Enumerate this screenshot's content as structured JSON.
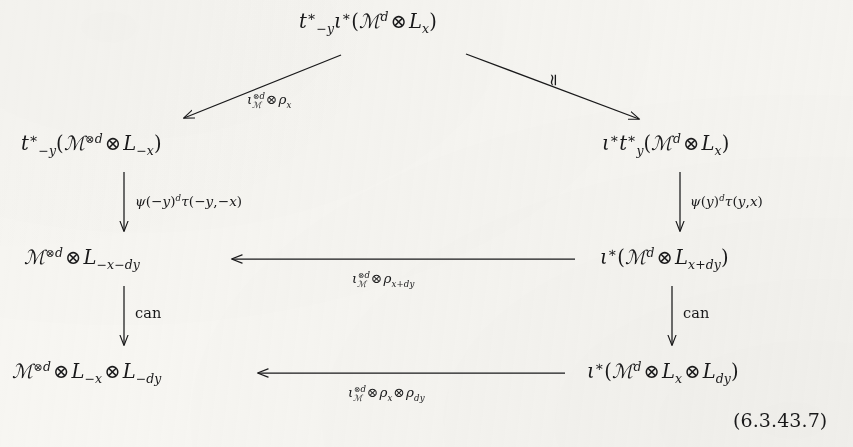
{
  "figure": {
    "type": "commutative-diagram",
    "equation_number": "(6.3.43.7)",
    "background_color": "#f7f6f2",
    "ink_color": "#19191a"
  },
  "nodes": {
    "top": {
      "id": "top-node",
      "latex": "t^*_{-y}\\iota^*(\\mathscr{M}^d \\otimes L_x)",
      "plain": "t*_{-y} i*(M^d ⊗ L_x)"
    },
    "upper_left": {
      "id": "upper-left-node",
      "latex": "t^*_{-y}(\\mathscr{M}^{\\otimes d} \\otimes L_{-x})",
      "plain": "t*_{-y}(M^{⊗d} ⊗ L_{-x})"
    },
    "upper_right": {
      "id": "upper-right-node",
      "latex": "\\iota^* t^*_{y}(\\mathscr{M}^d \\otimes L_x)",
      "plain": "i* t*_y(M^d ⊗ L_x)"
    },
    "middle_left": {
      "id": "middle-left-node",
      "latex": "\\mathscr{M}^{\\otimes d} \\otimes L_{-x-dy}",
      "plain": "M^{⊗d} ⊗ L_{-x-dy}"
    },
    "middle_right": {
      "id": "middle-right-node",
      "latex": "\\iota^*(\\mathscr{M}^d \\otimes L_{x+dy})",
      "plain": "i*(M^d ⊗ L_{x+dy})"
    },
    "bottom_left": {
      "id": "bottom-left-node",
      "latex": "\\mathscr{M}^{\\otimes d} \\otimes L_{-x} \\otimes L_{-dy}",
      "plain": "M^{⊗d} ⊗ L_{-x} ⊗ L_{-dy}"
    },
    "bottom_right": {
      "id": "bottom-right-node",
      "latex": "\\iota^*(\\mathscr{M}^d \\otimes L_x \\otimes L_{dy})",
      "plain": "i*(M^d ⊗ L_x ⊗ L_{dy})"
    }
  },
  "arrows": {
    "diag_left": {
      "from": "top",
      "to": "upper_left",
      "direction": "down-left",
      "label_latex": "\\iota_{\\mathscr{M}}^{\\otimes d} \\otimes \\rho_x",
      "label_plain": "i_M^{⊗d} ⊗ ρ_x"
    },
    "diag_right": {
      "from": "top",
      "to": "upper_right",
      "direction": "down-right",
      "label_latex": "\\simeq",
      "label_plain": "≃"
    },
    "left_vert_1": {
      "from": "upper_left",
      "to": "middle_left",
      "direction": "down",
      "label_latex": "\\psi(-y)^d \\tau(-y,-x)",
      "label_plain": "ψ(−y)^d τ(−y,−x)"
    },
    "right_vert_1": {
      "from": "upper_right",
      "to": "middle_right",
      "direction": "down",
      "label_latex": "\\psi(y)^d \\tau(y,x)",
      "label_plain": "ψ(y)^d τ(y,x)"
    },
    "middle_horiz": {
      "from": "middle_right",
      "to": "middle_left",
      "direction": "left",
      "label_latex": "\\iota_{\\mathscr{M}}^{\\otimes d} \\otimes \\rho_{x+dy}",
      "label_plain": "i_M^{⊗d} ⊗ ρ_{x+dy}"
    },
    "left_vert_2": {
      "from": "middle_left",
      "to": "bottom_left",
      "direction": "down",
      "label_latex": "\\mathrm{can}",
      "label_plain": "can"
    },
    "right_vert_2": {
      "from": "middle_right",
      "to": "bottom_right",
      "direction": "down",
      "label_latex": "\\mathrm{can}",
      "label_plain": "can"
    },
    "bottom_horiz": {
      "from": "bottom_right",
      "to": "bottom_left",
      "direction": "left",
      "label_latex": "\\iota_{\\mathscr{M}}^{\\otimes d} \\otimes \\rho_x \\otimes \\rho_{dy}",
      "label_plain": "i_M^{⊗d} ⊗ ρ_x ⊗ ρ_{dy}"
    }
  },
  "symbols": {
    "t": "t",
    "iota": "ι",
    "script_M": "ℳ",
    "L": "L",
    "psi": "ψ",
    "tau": "τ",
    "rho": "ρ",
    "tensor": "⊗",
    "star": "∗",
    "simeq": "≃",
    "can": "can",
    "d": "d",
    "x": "x",
    "y": "y",
    "minus": "−",
    "plus": "+"
  },
  "labels": {
    "equation_number": "(6.3.43.7)"
  }
}
